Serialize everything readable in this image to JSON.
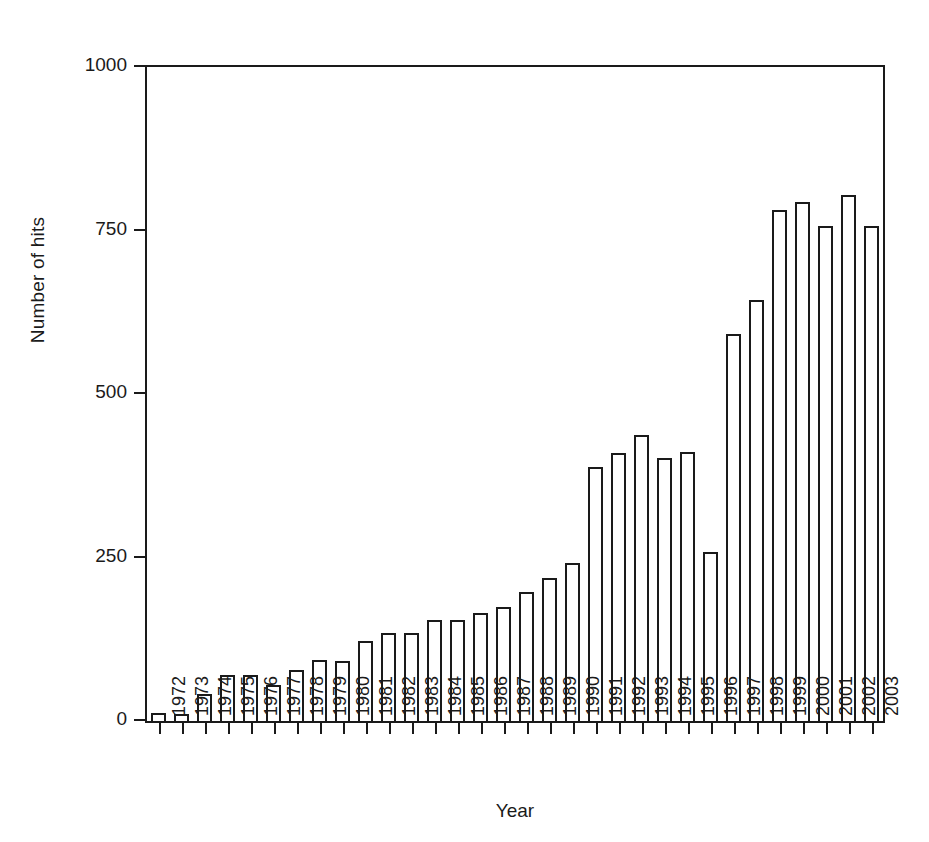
{
  "chart_data": {
    "type": "bar",
    "title": "",
    "xlabel": "Year",
    "ylabel": "Number of hits",
    "ylim": [
      0,
      1000
    ],
    "yticks": [
      0,
      250,
      500,
      750,
      1000
    ],
    "grid": false,
    "legend": null,
    "bar_style": {
      "fill": "#ffffff",
      "edge": "#1a1a1a",
      "edge_width_px": 2
    },
    "axis_color": "#1a1a1a",
    "background": "#ffffff",
    "xtick_rotation_deg": 90,
    "categories": [
      "1972",
      "1973",
      "1974",
      "1975",
      "1976",
      "1977",
      "1978",
      "1979",
      "1980",
      "1981",
      "1982",
      "1983",
      "1984",
      "1985",
      "1986",
      "1987",
      "1988",
      "1989",
      "1990",
      "1991",
      "1992",
      "1993",
      "1994",
      "1995",
      "1996",
      "1997",
      "1998",
      "1999",
      "2000",
      "2001",
      "2002",
      "2003"
    ],
    "values": [
      12,
      10,
      41,
      70,
      70,
      55,
      78,
      93,
      92,
      123,
      134,
      135,
      155,
      154,
      165,
      174,
      197,
      218,
      242,
      388,
      410,
      438,
      402,
      412,
      258,
      592,
      644,
      782,
      793,
      757,
      805,
      757
    ]
  }
}
